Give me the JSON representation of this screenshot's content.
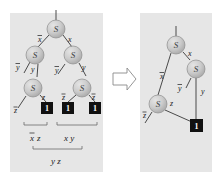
{
  "figure": {
    "kind": "decision-diagram-reduction",
    "background_color": "#ffffff",
    "panel_color": "#e6e6e6",
    "node_color": "#cfcfcf",
    "terminal_color": "#111111",
    "edge_color": "#4a4a4a",
    "node_label": "S",
    "terminal_label": "1",
    "arrow_label": "implies-arrow"
  },
  "left_diagram": {
    "title": "",
    "nodes": [
      {
        "id": "root",
        "label": "S"
      },
      {
        "id": "n-l",
        "label": "S"
      },
      {
        "id": "n-r",
        "label": "S"
      },
      {
        "id": "n-ll",
        "label": "S"
      },
      {
        "id": "n-rr",
        "label": "S"
      }
    ],
    "terminals": [
      {
        "id": "t1",
        "label": "1"
      },
      {
        "id": "t2",
        "label": "1"
      },
      {
        "id": "t3",
        "label": "1"
      }
    ],
    "edge_labels": [
      {
        "id": "e-root-left",
        "text": "x",
        "overbar": true
      },
      {
        "id": "e-root-right",
        "text": "x",
        "overbar": false
      },
      {
        "id": "e-l-left",
        "text": "y",
        "overbar": true
      },
      {
        "id": "e-l-right",
        "text": "y",
        "overbar": false
      },
      {
        "id": "e-r-left",
        "text": "y",
        "overbar": true
      },
      {
        "id": "e-r-right",
        "text": "y",
        "overbar": false
      },
      {
        "id": "e-ll-left",
        "text": "z",
        "overbar": true
      },
      {
        "id": "e-ll-right",
        "text": "z",
        "overbar": false
      },
      {
        "id": "e-rr-left",
        "text": "z",
        "overbar": true
      },
      {
        "id": "e-rr-right",
        "text": "z",
        "overbar": false
      }
    ],
    "brackets": [
      {
        "id": "bracket-left",
        "label_over": "x",
        "label_plain": "z"
      },
      {
        "id": "bracket-right",
        "label_over": "",
        "label_plain": "x y"
      },
      {
        "id": "bracket-bottom",
        "label_over": "",
        "label_plain": "y z"
      }
    ]
  },
  "right_diagram": {
    "nodes": [
      {
        "id": "r-root",
        "label": "S"
      },
      {
        "id": "r-rt",
        "label": "S"
      },
      {
        "id": "r-lf",
        "label": "S"
      }
    ],
    "terminals": [
      {
        "id": "r-t1",
        "label": "1"
      }
    ],
    "edge_labels": [
      {
        "id": "re-root-right",
        "text": "x",
        "overbar": false
      },
      {
        "id": "re-root-left",
        "text": "x",
        "overbar": true
      },
      {
        "id": "re-rt-left",
        "text": "y",
        "overbar": true
      },
      {
        "id": "re-rt-right",
        "text": "y",
        "overbar": false
      },
      {
        "id": "re-lf-left",
        "text": "z",
        "overbar": true
      },
      {
        "id": "re-lf-right",
        "text": "z",
        "overbar": false
      }
    ]
  }
}
